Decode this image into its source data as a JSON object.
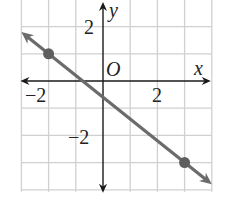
{
  "chart_data": {
    "type": "line",
    "title": "",
    "xlabel": "x",
    "ylabel": "y",
    "origin_label": "O",
    "xlim": [
      -3,
      4
    ],
    "ylim": [
      -4,
      3
    ],
    "grid": true,
    "x_ticks": [
      {
        "value": -2,
        "label": "−2"
      },
      {
        "value": 2,
        "label": "2"
      }
    ],
    "y_ticks": [
      {
        "value": 2,
        "label": "2"
      },
      {
        "value": -2,
        "label": "−2"
      }
    ],
    "series": [
      {
        "name": "line",
        "points": [
          {
            "x": -2,
            "y": 1
          },
          {
            "x": 3,
            "y": -3
          }
        ],
        "slope": -0.8,
        "y_intercept": -0.6,
        "arrows_both_ends": true,
        "color": "#6b6b6b"
      }
    ]
  },
  "colors": {
    "grid": "#d0d0d0",
    "axis": "#1a1a1a",
    "line": "#6b6b6b",
    "point": "#5e5e5e"
  },
  "labels": {
    "x_axis": "x",
    "y_axis": "y",
    "origin": "O",
    "x_tick_neg2": "−2",
    "x_tick_2": "2",
    "y_tick_2": "2",
    "y_tick_neg2": "−2"
  }
}
